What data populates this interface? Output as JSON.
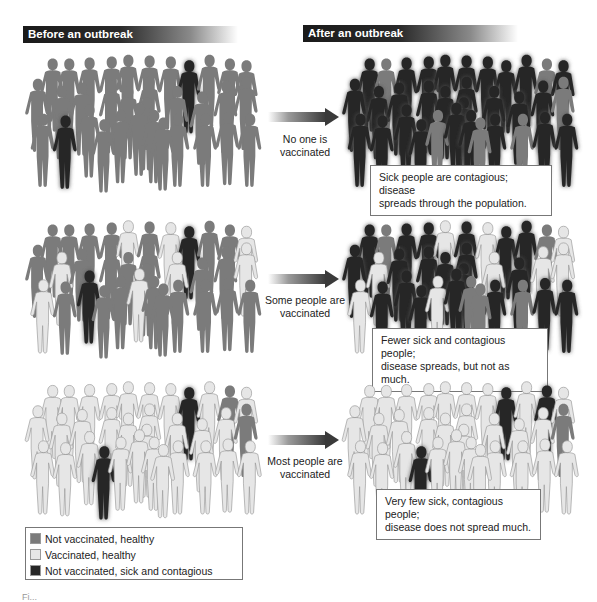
{
  "headers": {
    "before": "Before an outbreak",
    "after": "After an outbreak"
  },
  "colors": {
    "not_vaccinated_healthy": "#7b7b7b",
    "vaccinated_healthy": "#e6e6e6",
    "sick": "#262626",
    "outline": "#9a9a9a"
  },
  "scenarios": [
    {
      "arrow_label_line1": "No one is",
      "arrow_label_line2": "vaccinated",
      "callout_line1": "Sick people are contagious; disease",
      "callout_line2": "spreads through the population.",
      "before_states": [
        "N",
        "N",
        "N",
        "N",
        "N",
        "N",
        "N",
        "S",
        "N",
        "N",
        "N",
        "N",
        "N",
        "N",
        "N",
        "N",
        "N",
        "N",
        "N",
        "N",
        "N",
        "N",
        "N",
        "S",
        "N",
        "N",
        "N",
        "N",
        "N",
        "N",
        "N",
        "N",
        "N",
        "N"
      ],
      "after_states": [
        "S",
        "N",
        "S",
        "S",
        "S",
        "S",
        "S",
        "S",
        "S",
        "N",
        "S",
        "S",
        "S",
        "S",
        "S",
        "S",
        "S",
        "S",
        "S",
        "S",
        "N",
        "S",
        "S",
        "S",
        "S",
        "S",
        "N",
        "S",
        "S",
        "S",
        "N",
        "S",
        "S",
        "N"
      ]
    },
    {
      "arrow_label_line1": "Some people are",
      "arrow_label_line2": "vaccinated",
      "callout_line1": "Fewer sick and contagious people;",
      "callout_line2": "disease spreads, but not as much.",
      "before_states": [
        "N",
        "N",
        "N",
        "N",
        "V",
        "N",
        "V",
        "S",
        "N",
        "N",
        "V",
        "N",
        "V",
        "N",
        "N",
        "N",
        "N",
        "V",
        "N",
        "N",
        "V",
        "N",
        "V",
        "N",
        "S",
        "N",
        "N",
        "V",
        "N",
        "N",
        "N",
        "N",
        "N",
        "N"
      ],
      "after_states": [
        "S",
        "N",
        "S",
        "S",
        "V",
        "S",
        "V",
        "S",
        "S",
        "N",
        "V",
        "S",
        "V",
        "S",
        "S",
        "S",
        "S",
        "V",
        "S",
        "V",
        "V",
        "S",
        "V",
        "S",
        "S",
        "S",
        "V",
        "S",
        "N",
        "S",
        "N",
        "S",
        "S",
        "N"
      ]
    },
    {
      "arrow_label_line1": "Most people are",
      "arrow_label_line2": "vaccinated",
      "callout_line1": "Very few sick, contagious people;",
      "callout_line2": "disease does not spread much.",
      "before_states": [
        "V",
        "V",
        "V",
        "V",
        "V",
        "V",
        "V",
        "S",
        "V",
        "N",
        "V",
        "V",
        "V",
        "V",
        "V",
        "V",
        "V",
        "V",
        "V",
        "V",
        "N",
        "V",
        "V",
        "V",
        "V",
        "S",
        "V",
        "V",
        "V",
        "V",
        "V",
        "V",
        "V",
        "V"
      ],
      "after_states": [
        "V",
        "V",
        "V",
        "V",
        "V",
        "V",
        "V",
        "S",
        "V",
        "S",
        "V",
        "V",
        "V",
        "V",
        "V",
        "V",
        "V",
        "V",
        "V",
        "V",
        "N",
        "V",
        "V",
        "V",
        "V",
        "S",
        "V",
        "V",
        "V",
        "V",
        "V",
        "V",
        "V",
        "V"
      ]
    }
  ],
  "legend": [
    {
      "label": "Not vaccinated, healthy",
      "state": "N"
    },
    {
      "label": "Vaccinated, healthy",
      "state": "V"
    },
    {
      "label": "Not vaccinated, sick and contagious",
      "state": "S"
    }
  ],
  "figure_label": "Fi..."
}
